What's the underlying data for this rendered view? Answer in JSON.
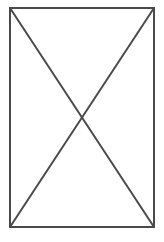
{
  "canvas": {
    "width": 164,
    "height": 242,
    "background_color": "#ffffff"
  },
  "figure": {
    "name": "rectangle-with-diagonals",
    "stroke_color": "#4a4a4a",
    "stroke_width": 2,
    "fill_color": "none",
    "rect": {
      "x": 10,
      "y": 8,
      "width": 144,
      "height": 219,
      "left": 10,
      "top": 8,
      "right": 154,
      "bottom": 227
    },
    "diagonals": [
      {
        "name": "diagonal-top-left-to-bottom-right",
        "x1": 10,
        "y1": 8,
        "x2": 154,
        "y2": 227
      },
      {
        "name": "diagonal-bottom-left-to-top-right",
        "x1": 10,
        "y1": 227,
        "x2": 154,
        "y2": 8
      }
    ],
    "intersection": {
      "x": 82,
      "y": 117.5
    }
  },
  "chart_data": {
    "type": "diagram",
    "title": "",
    "shapes": [
      {
        "kind": "rectangle",
        "label": "outer-border",
        "points": [
          [
            10,
            8
          ],
          [
            154,
            8
          ],
          [
            154,
            227
          ],
          [
            10,
            227
          ]
        ],
        "stroke": "#4a4a4a",
        "stroke_width": 2,
        "fill": "none"
      },
      {
        "kind": "line",
        "label": "diagonal-1",
        "points": [
          [
            10,
            8
          ],
          [
            154,
            227
          ]
        ],
        "stroke": "#4a4a4a",
        "stroke_width": 2
      },
      {
        "kind": "line",
        "label": "diagonal-2",
        "points": [
          [
            10,
            227
          ],
          [
            154,
            8
          ]
        ],
        "stroke": "#4a4a4a",
        "stroke_width": 2
      }
    ],
    "annotations": [],
    "legend": [],
    "grid": false
  }
}
